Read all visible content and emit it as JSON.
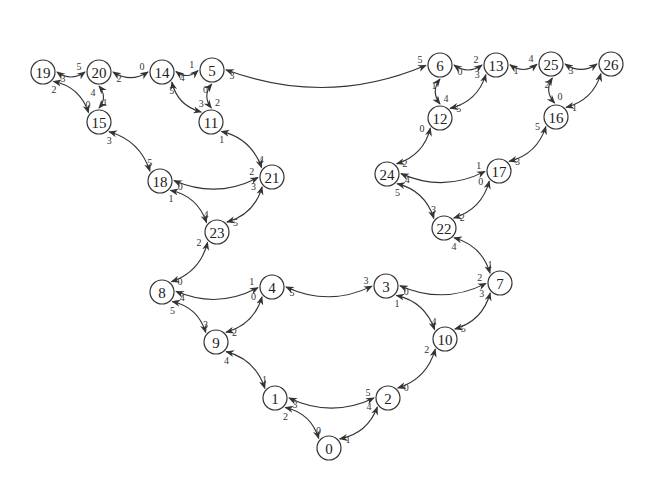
{
  "diagram": {
    "type": "graph",
    "nodes": [
      {
        "id": "0",
        "label": "0",
        "x": 329,
        "y": 448
      },
      {
        "id": "1",
        "label": "1",
        "x": 275,
        "y": 398
      },
      {
        "id": "2",
        "label": "2",
        "x": 388,
        "y": 398
      },
      {
        "id": "3",
        "label": "3",
        "x": 386,
        "y": 286
      },
      {
        "id": "4",
        "label": "4",
        "x": 272,
        "y": 287
      },
      {
        "id": "5",
        "label": "5",
        "x": 212,
        "y": 70
      },
      {
        "id": "6",
        "label": "6",
        "x": 440,
        "y": 65
      },
      {
        "id": "7",
        "label": "7",
        "x": 500,
        "y": 283
      },
      {
        "id": "8",
        "label": "8",
        "x": 162,
        "y": 292
      },
      {
        "id": "9",
        "label": "9",
        "x": 216,
        "y": 342
      },
      {
        "id": "10",
        "label": "10",
        "x": 445,
        "y": 339
      },
      {
        "id": "11",
        "label": "11",
        "x": 211,
        "y": 122
      },
      {
        "id": "12",
        "label": "12",
        "x": 440,
        "y": 118
      },
      {
        "id": "13",
        "label": "13",
        "x": 496,
        "y": 65
      },
      {
        "id": "14",
        "label": "14",
        "x": 162,
        "y": 72
      },
      {
        "id": "15",
        "label": "15",
        "x": 99,
        "y": 122
      },
      {
        "id": "16",
        "label": "16",
        "x": 556,
        "y": 117
      },
      {
        "id": "17",
        "label": "17",
        "x": 499,
        "y": 171
      },
      {
        "id": "18",
        "label": "18",
        "x": 160,
        "y": 181
      },
      {
        "id": "19",
        "label": "19",
        "x": 43,
        "y": 72
      },
      {
        "id": "20",
        "label": "20",
        "x": 99,
        "y": 72
      },
      {
        "id": "21",
        "label": "21",
        "x": 272,
        "y": 177
      },
      {
        "id": "22",
        "label": "22",
        "x": 444,
        "y": 228
      },
      {
        "id": "23",
        "label": "23",
        "x": 217,
        "y": 232
      },
      {
        "id": "24",
        "label": "24",
        "x": 387,
        "y": 174
      },
      {
        "id": "25",
        "label": "25",
        "x": 551,
        "y": 64
      },
      {
        "id": "26",
        "label": "26",
        "x": 611,
        "y": 64
      }
    ],
    "edges": [
      {
        "from": "0",
        "from_port": "0",
        "to": "1",
        "to_port": "2"
      },
      {
        "from": "0",
        "from_port": "1",
        "to": "2",
        "to_port": "4"
      },
      {
        "from": "1",
        "from_port": "3",
        "to": "2",
        "to_port": "5"
      },
      {
        "from": "1",
        "from_port": "1",
        "to": "9",
        "to_port": "4"
      },
      {
        "from": "2",
        "from_port": "0",
        "to": "10",
        "to_port": "2"
      },
      {
        "from": "9",
        "from_port": "3",
        "to": "8",
        "to_port": "5"
      },
      {
        "from": "9",
        "from_port": "2",
        "to": "4",
        "to_port": "0"
      },
      {
        "from": "10",
        "from_port": "4",
        "to": "3",
        "to_port": "1"
      },
      {
        "from": "10",
        "from_port": "5",
        "to": "7",
        "to_port": "3"
      },
      {
        "from": "8",
        "from_port": "4",
        "to": "4",
        "to_port": "1"
      },
      {
        "from": "4",
        "from_port": "5",
        "to": "3",
        "to_port": "3"
      },
      {
        "from": "3",
        "from_port": "0",
        "to": "7",
        "to_port": "2"
      },
      {
        "from": "8",
        "from_port": "0",
        "to": "23",
        "to_port": "2"
      },
      {
        "from": "7",
        "from_port": "1",
        "to": "22",
        "to_port": "4"
      },
      {
        "from": "23",
        "from_port": "4",
        "to": "18",
        "to_port": "1"
      },
      {
        "from": "23",
        "from_port": "5",
        "to": "21",
        "to_port": "3"
      },
      {
        "from": "22",
        "from_port": "3",
        "to": "24",
        "to_port": "5"
      },
      {
        "from": "22",
        "from_port": "2",
        "to": "17",
        "to_port": "0"
      },
      {
        "from": "18",
        "from_port": "0",
        "to": "21",
        "to_port": "2"
      },
      {
        "from": "24",
        "from_port": "4",
        "to": "17",
        "to_port": "1"
      },
      {
        "from": "18",
        "from_port": "5",
        "to": "15",
        "to_port": "3"
      },
      {
        "from": "21",
        "from_port": "4",
        "to": "11",
        "to_port": "1"
      },
      {
        "from": "24",
        "from_port": "2",
        "to": "12",
        "to_port": "0"
      },
      {
        "from": "17",
        "from_port": "3",
        "to": "16",
        "to_port": "5"
      },
      {
        "from": "15",
        "from_port": "0",
        "to": "19",
        "to_port": "2"
      },
      {
        "from": "15",
        "from_port": "1",
        "to": "20",
        "to_port": "4"
      },
      {
        "from": "19",
        "from_port": "3",
        "to": "20",
        "to_port": "5"
      },
      {
        "from": "20",
        "from_port": "2",
        "to": "14",
        "to_port": "0"
      },
      {
        "from": "14",
        "from_port": "4",
        "to": "5",
        "to_port": "1"
      },
      {
        "from": "14",
        "from_port": "5",
        "to": "11",
        "to_port": "3"
      },
      {
        "from": "5",
        "from_port": "0",
        "to": "11",
        "to_port": "2"
      },
      {
        "from": "5",
        "from_port": "3",
        "to": "6",
        "to_port": "5"
      },
      {
        "from": "6",
        "from_port": "0",
        "to": "13",
        "to_port": "2"
      },
      {
        "from": "6",
        "from_port": "1",
        "to": "12",
        "to_port": "4"
      },
      {
        "from": "12",
        "from_port": "5",
        "to": "13",
        "to_port": "3"
      },
      {
        "from": "13",
        "from_port": "1",
        "to": "25",
        "to_port": "4"
      },
      {
        "from": "25",
        "from_port": "3",
        "to": "26",
        "to_port": ""
      },
      {
        "from": "25",
        "from_port": "2",
        "to": "16",
        "to_port": "0"
      },
      {
        "from": "16",
        "from_port": "1",
        "to": "26",
        "to_port": ""
      }
    ],
    "colors": {
      "background": "#ffffff",
      "stroke": "#333333",
      "text": "#222222"
    }
  }
}
